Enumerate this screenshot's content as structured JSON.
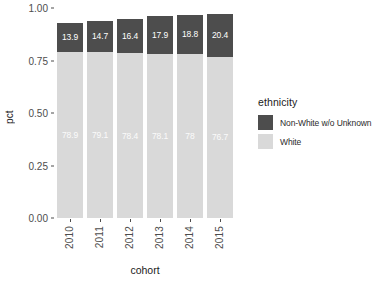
{
  "chart_data": {
    "type": "bar",
    "stacked": true,
    "title": "",
    "xlabel": "cohort",
    "ylabel": "pct",
    "categories": [
      "2010",
      "2011",
      "2012",
      "2013",
      "2014",
      "2015"
    ],
    "ylim": [
      0.0,
      1.0
    ],
    "ytick_labels": [
      "0.00",
      "0.25",
      "0.50",
      "0.75",
      "1.00"
    ],
    "ytick_values": [
      0.0,
      0.25,
      0.5,
      0.75,
      1.0
    ],
    "grid": false,
    "legend_position": "right",
    "legend_title": "ethnicity",
    "series": [
      {
        "name": "Non-White w/o Unknown",
        "color": "#4d4d4d",
        "values": [
          13.9,
          14.7,
          16.4,
          17.9,
          18.8,
          20.4
        ],
        "data_labels": [
          "13.9",
          "14.7",
          "16.4",
          "17.9",
          "18.8",
          "20.4"
        ]
      },
      {
        "name": "White",
        "color": "#d9d9d9",
        "values": [
          78.9,
          79.1,
          78.4,
          78.1,
          78.0,
          76.7
        ],
        "data_labels": [
          "78.9",
          "79.1",
          "78.4",
          "78.1",
          "78",
          "76.7"
        ]
      }
    ]
  },
  "axis": {
    "y_title": "pct",
    "x_title": "cohort"
  }
}
